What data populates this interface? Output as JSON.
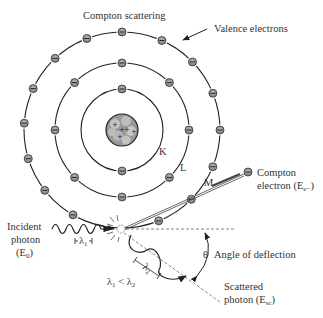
{
  "title": "Compton scattering",
  "labels": {
    "valence": "Valence electrons",
    "shell_k": "K",
    "shell_l": "L",
    "shell_m": "M",
    "compton_line1": "Compton",
    "compton_line2": "electron (E",
    "compton_sub": "e−",
    "incident_line1": "Incident",
    "incident_line2": "photon",
    "incident_line3": "(E",
    "incident_sub": "0",
    "lambda1": "λ",
    "lambda1_sub": "1",
    "lambda2": "λ",
    "lambda2_sub": "2",
    "lambda_relation": "λ",
    "rel_sub1": "1",
    "rel_mid": " < λ",
    "rel_sub2": "2",
    "theta": "θ",
    "angle": "Angle of deflection",
    "scattered_line1": "Scattered",
    "scattered_line2": "photon (E",
    "scattered_sub": "sc"
  },
  "shells": [
    {
      "name": "K",
      "electron_angles_deg": [
        90,
        270
      ]
    },
    {
      "name": "L",
      "electron_angles_deg": [
        90,
        45,
        0,
        315,
        270,
        225,
        180,
        135
      ]
    },
    {
      "name": "M",
      "electron_angles_deg": [
        90,
        66,
        44,
        22,
        0,
        338,
        315,
        292,
        240,
        218,
        197,
        176,
        155,
        133,
        111
      ]
    }
  ],
  "icons": {
    "electron": "minus-circle",
    "nucleus": "plus-cluster"
  }
}
